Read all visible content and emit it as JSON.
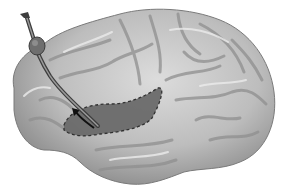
{
  "image": {
    "subject": "brain lateral view illustration",
    "style": "grayscale",
    "elements": {
      "brain": "brain-hemisphere",
      "probe": "inserted probe / catheter",
      "highlight_region": "dashed outlined region",
      "arrow": "direction arrow"
    },
    "colors": {
      "background": "#ffffff",
      "brain_light": "#d4d4d4",
      "brain_mid": "#a8a8a8",
      "brain_dark": "#6e6e6e",
      "region_fill": "#6a6a6a",
      "probe": "#5a5a5a",
      "outline": "#2a2a2a"
    }
  }
}
